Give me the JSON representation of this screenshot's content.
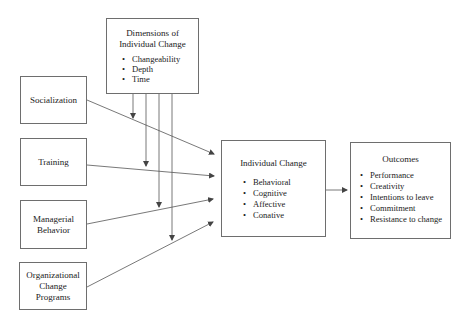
{
  "diagram": {
    "dimensions": {
      "title_lines": [
        "Dimensions of",
        "Individual Change"
      ],
      "items": [
        "Changeability",
        "Depth",
        "Time"
      ]
    },
    "antecedents": [
      {
        "lines": [
          "Socialization"
        ]
      },
      {
        "lines": [
          "Training"
        ]
      },
      {
        "lines": [
          "Managerial",
          "Behavior"
        ]
      },
      {
        "lines": [
          "Organizational",
          "Change",
          "Programs"
        ]
      }
    ],
    "individual_change": {
      "title": "Individual Change",
      "items": [
        "Behavioral",
        "Cognitive",
        "Affective",
        "Conative"
      ]
    },
    "outcomes": {
      "title": "Outcomes",
      "items": [
        "Performance",
        "Creativity",
        "Intentions to leave",
        "Commitment",
        "Resistance to change"
      ]
    },
    "colors": {
      "line": "#555555",
      "border": "#6e6e6e",
      "text": "#222222"
    }
  }
}
